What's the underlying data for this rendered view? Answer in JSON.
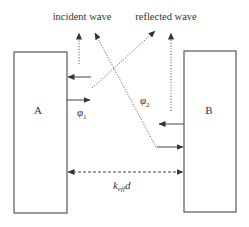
{
  "diagram": {
    "labels": {
      "incident_wave": "incident wave",
      "reflected_wave": "reflected wave",
      "box_a": "A",
      "box_b": "B",
      "phi1_symbol": "φ",
      "phi1_sub": "1",
      "phi2_symbol": "φ",
      "phi2_sub": "2",
      "distance_k": "k",
      "distance_sub": "eff",
      "distance_d": "d"
    },
    "colors": {
      "stroke": "#444444",
      "text": "#333333",
      "background": "#ffffff"
    }
  }
}
